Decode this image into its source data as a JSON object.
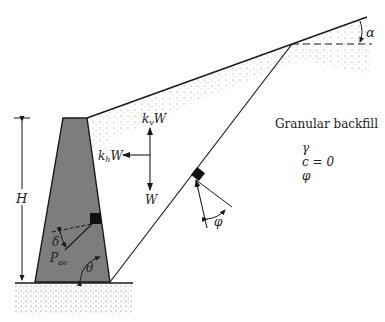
{
  "labels": {
    "height": "H",
    "alpha": "α",
    "kv_k": "k",
    "kv_sub": "v",
    "kv_w": "W",
    "kh_k": "k",
    "kh_sub": "h",
    "kh_w": "W",
    "weight": "W",
    "phi_wedge": "φ",
    "delta": "δ",
    "pae_p": "P",
    "pae_sub": "ae",
    "theta": "θ"
  },
  "backfill": {
    "title": "Granular backfill",
    "gamma": "γ",
    "cohesion": "c = 0",
    "phi": "φ"
  },
  "colors": {
    "wall_fill": "#7d7d7d",
    "line": "#1a1a1a",
    "soil_dots": "#555555",
    "background": "#ffffff"
  }
}
